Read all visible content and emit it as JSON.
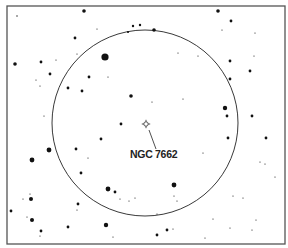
{
  "map": {
    "type": "star-chart",
    "frame": {
      "x": 7,
      "y": 6,
      "width": 278,
      "height": 238
    },
    "field_of_view": {
      "cx": 145,
      "cy": 123,
      "r": 93
    },
    "target": {
      "name": "NGC 7662",
      "symbol": "planetary-nebula",
      "x": 146,
      "y": 124,
      "label": {
        "text": "NGC 7662",
        "x": 130,
        "y": 158
      },
      "leader": {
        "x1": 149,
        "y1": 130,
        "x2": 156,
        "y2": 149
      }
    },
    "stars": [
      {
        "x": 84,
        "y": 11,
        "r": 1.8
      },
      {
        "x": 17,
        "y": 16,
        "r": 0.7
      },
      {
        "x": 97,
        "y": 29,
        "r": 0.6
      },
      {
        "x": 133,
        "y": 26,
        "r": 1.2
      },
      {
        "x": 140,
        "y": 25,
        "r": 1.2
      },
      {
        "x": 128,
        "y": 32,
        "r": 1.1
      },
      {
        "x": 154,
        "y": 30,
        "r": 1.8
      },
      {
        "x": 218,
        "y": 11,
        "r": 1.8
      },
      {
        "x": 231,
        "y": 21,
        "r": 1.4
      },
      {
        "x": 222,
        "y": 30,
        "r": 0.6
      },
      {
        "x": 255,
        "y": 33,
        "r": 0.6
      },
      {
        "x": 75,
        "y": 38,
        "r": 1.4
      },
      {
        "x": 77,
        "y": 54,
        "r": 0.6
      },
      {
        "x": 105,
        "y": 57,
        "r": 3.6
      },
      {
        "x": 15,
        "y": 64,
        "r": 1.8
      },
      {
        "x": 41,
        "y": 62,
        "r": 1.4
      },
      {
        "x": 56,
        "y": 60,
        "r": 0.6
      },
      {
        "x": 178,
        "y": 53,
        "r": 0.6
      },
      {
        "x": 198,
        "y": 56,
        "r": 0.6
      },
      {
        "x": 230,
        "y": 61,
        "r": 1.4
      },
      {
        "x": 254,
        "y": 56,
        "r": 0.6
      },
      {
        "x": 50,
        "y": 74,
        "r": 1.4
      },
      {
        "x": 36,
        "y": 80,
        "r": 0.6
      },
      {
        "x": 40,
        "y": 86,
        "r": 0.6
      },
      {
        "x": 89,
        "y": 77,
        "r": 1.4
      },
      {
        "x": 108,
        "y": 77,
        "r": 0.6
      },
      {
        "x": 250,
        "y": 71,
        "r": 1.4
      },
      {
        "x": 230,
        "y": 79,
        "r": 1.4
      },
      {
        "x": 68,
        "y": 88,
        "r": 1.4
      },
      {
        "x": 82,
        "y": 91,
        "r": 1.4
      },
      {
        "x": 131,
        "y": 96,
        "r": 1.8
      },
      {
        "x": 183,
        "y": 99,
        "r": 0.6
      },
      {
        "x": 152,
        "y": 102,
        "r": 0.6
      },
      {
        "x": 44,
        "y": 116,
        "r": 0.6
      },
      {
        "x": 225,
        "y": 108,
        "r": 2.2
      },
      {
        "x": 227,
        "y": 116,
        "r": 1.4
      },
      {
        "x": 252,
        "y": 116,
        "r": 1.4
      },
      {
        "x": 121,
        "y": 124,
        "r": 1.4
      },
      {
        "x": 101,
        "y": 139,
        "r": 1.4
      },
      {
        "x": 76,
        "y": 149,
        "r": 1.4
      },
      {
        "x": 49,
        "y": 150,
        "r": 2.4
      },
      {
        "x": 88,
        "y": 158,
        "r": 0.6
      },
      {
        "x": 32,
        "y": 160,
        "r": 2.4
      },
      {
        "x": 228,
        "y": 138,
        "r": 1.4
      },
      {
        "x": 266,
        "y": 138,
        "r": 1.4
      },
      {
        "x": 203,
        "y": 153,
        "r": 0.6
      },
      {
        "x": 81,
        "y": 173,
        "r": 1.4
      },
      {
        "x": 260,
        "y": 162,
        "r": 0.6
      },
      {
        "x": 265,
        "y": 164,
        "r": 0.6
      },
      {
        "x": 275,
        "y": 177,
        "r": 0.6
      },
      {
        "x": 174,
        "y": 185,
        "r": 2.4
      },
      {
        "x": 108,
        "y": 189,
        "r": 2.4
      },
      {
        "x": 115,
        "y": 192,
        "r": 1.4
      },
      {
        "x": 120,
        "y": 199,
        "r": 0.6
      },
      {
        "x": 129,
        "y": 201,
        "r": 0.6
      },
      {
        "x": 135,
        "y": 198,
        "r": 0.6
      },
      {
        "x": 174,
        "y": 196,
        "r": 0.6
      },
      {
        "x": 177,
        "y": 201,
        "r": 0.6
      },
      {
        "x": 233,
        "y": 196,
        "r": 0.6
      },
      {
        "x": 243,
        "y": 198,
        "r": 0.6
      },
      {
        "x": 30,
        "y": 194,
        "r": 0.6
      },
      {
        "x": 23,
        "y": 199,
        "r": 0.6
      },
      {
        "x": 31,
        "y": 199,
        "r": 2.0
      },
      {
        "x": 11,
        "y": 211,
        "r": 1.4
      },
      {
        "x": 78,
        "y": 204,
        "r": 1.4
      },
      {
        "x": 77,
        "y": 210,
        "r": 0.6
      },
      {
        "x": 27,
        "y": 217,
        "r": 0.6
      },
      {
        "x": 32,
        "y": 220,
        "r": 2.0
      },
      {
        "x": 157,
        "y": 214,
        "r": 0.6
      },
      {
        "x": 106,
        "y": 225,
        "r": 2.2
      },
      {
        "x": 167,
        "y": 230,
        "r": 1.4
      },
      {
        "x": 173,
        "y": 229,
        "r": 0.6
      },
      {
        "x": 68,
        "y": 227,
        "r": 1.4
      },
      {
        "x": 41,
        "y": 231,
        "r": 1.4
      },
      {
        "x": 40,
        "y": 236,
        "r": 0.6
      },
      {
        "x": 157,
        "y": 235,
        "r": 1.4
      },
      {
        "x": 113,
        "y": 237,
        "r": 0.6
      },
      {
        "x": 205,
        "y": 238,
        "r": 0.6
      },
      {
        "x": 230,
        "y": 228,
        "r": 0.6
      },
      {
        "x": 252,
        "y": 230,
        "r": 0.6
      },
      {
        "x": 256,
        "y": 220,
        "r": 0.6
      },
      {
        "x": 213,
        "y": 219,
        "r": 0.6
      }
    ]
  }
}
